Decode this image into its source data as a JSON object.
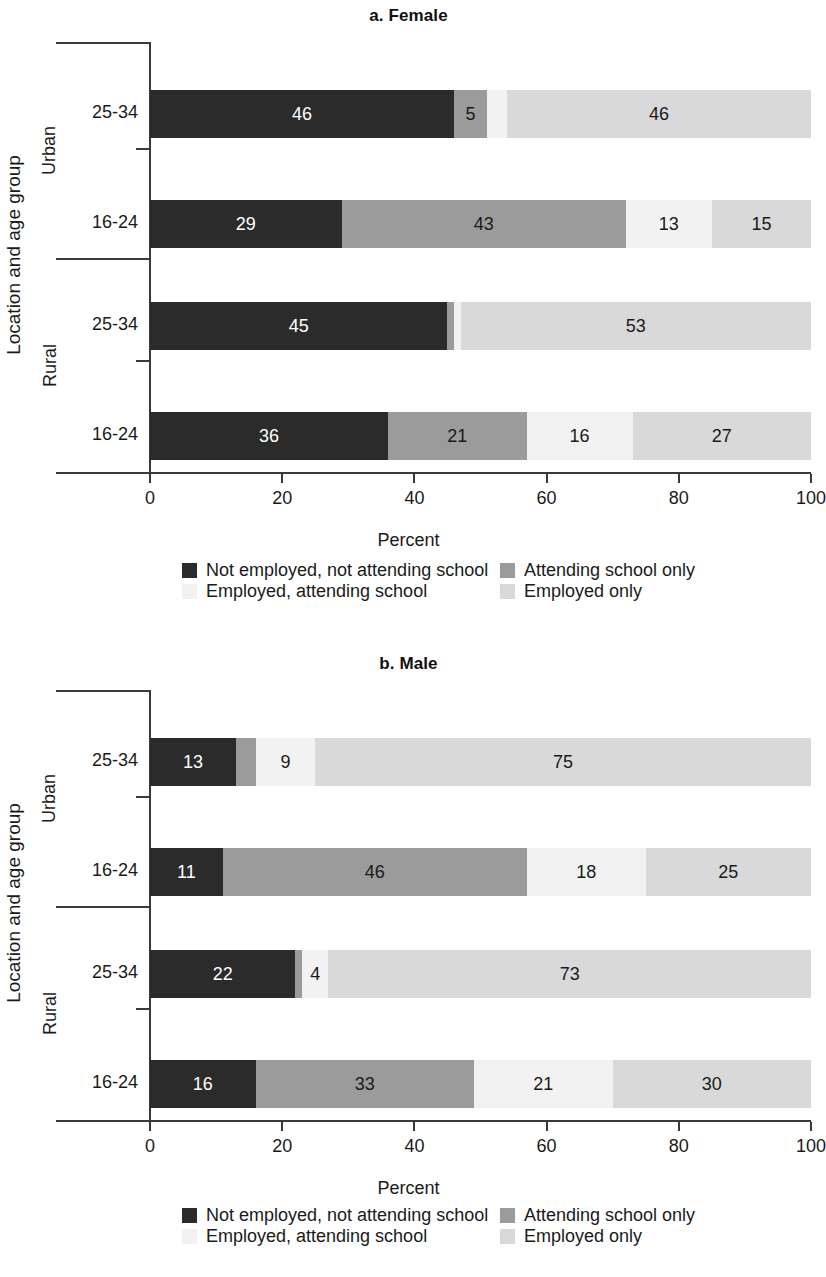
{
  "figure": {
    "xaxis_title": "Percent",
    "yaxis_title": "Location and age group",
    "xticks": [
      "0",
      "20",
      "40",
      "60",
      "80",
      "100"
    ],
    "xlim_min": 0,
    "xlim_max": 100
  },
  "legend": {
    "items": [
      {
        "label": "Not employed, not attending school",
        "color": "#2b2b2b",
        "key": "not_employed_not_attending"
      },
      {
        "label": "Attending school only",
        "color": "#9b9b9b",
        "key": "attending_only"
      },
      {
        "label": "Employed, attending school",
        "color": "#f2f2f2",
        "key": "employed_attending"
      },
      {
        "label": "Employed only",
        "color": "#d9d9d9",
        "key": "employed_only"
      }
    ]
  },
  "panels": [
    {
      "id": "panel-a",
      "title": "a. Female",
      "groups": [
        {
          "name": "Urban",
          "rows": [
            {
              "age": "25-34",
              "segments": [
                {
                  "series": "Not employed, not attending school",
                  "value": 46,
                  "label": "46",
                  "color": "#2b2b2b",
                  "text_color": "#ffffff",
                  "show_label": true
                },
                {
                  "series": "Attending school only",
                  "value": 5,
                  "label": "5",
                  "color": "#9b9b9b",
                  "text_color": "#1a1a1a",
                  "show_label": true
                },
                {
                  "series": "Employed, attending school",
                  "value": 3,
                  "label": "",
                  "color": "#f2f2f2",
                  "text_color": "#1a1a1a",
                  "show_label": false
                },
                {
                  "series": "Employed only",
                  "value": 46,
                  "label": "46",
                  "color": "#d9d9d9",
                  "text_color": "#1a1a1a",
                  "show_label": true
                }
              ]
            },
            {
              "age": "16-24",
              "segments": [
                {
                  "series": "Not employed, not attending school",
                  "value": 29,
                  "label": "29",
                  "color": "#2b2b2b",
                  "text_color": "#ffffff",
                  "show_label": true
                },
                {
                  "series": "Attending school only",
                  "value": 43,
                  "label": "43",
                  "color": "#9b9b9b",
                  "text_color": "#1a1a1a",
                  "show_label": true
                },
                {
                  "series": "Employed, attending school",
                  "value": 13,
                  "label": "13",
                  "color": "#f2f2f2",
                  "text_color": "#1a1a1a",
                  "show_label": true
                },
                {
                  "series": "Employed only",
                  "value": 15,
                  "label": "15",
                  "color": "#d9d9d9",
                  "text_color": "#1a1a1a",
                  "show_label": true
                }
              ]
            }
          ]
        },
        {
          "name": "Rural",
          "rows": [
            {
              "age": "25-34",
              "segments": [
                {
                  "series": "Not employed, not attending school",
                  "value": 45,
                  "label": "45",
                  "color": "#2b2b2b",
                  "text_color": "#ffffff",
                  "show_label": true
                },
                {
                  "series": "Attending school only",
                  "value": 1,
                  "label": "",
                  "color": "#9b9b9b",
                  "text_color": "#1a1a1a",
                  "show_label": false
                },
                {
                  "series": "Employed, attending school",
                  "value": 1,
                  "label": "",
                  "color": "#f2f2f2",
                  "text_color": "#1a1a1a",
                  "show_label": false
                },
                {
                  "series": "Employed only",
                  "value": 53,
                  "label": "53",
                  "color": "#d9d9d9",
                  "text_color": "#1a1a1a",
                  "show_label": true
                }
              ]
            },
            {
              "age": "16-24",
              "segments": [
                {
                  "series": "Not employed, not attending school",
                  "value": 36,
                  "label": "36",
                  "color": "#2b2b2b",
                  "text_color": "#ffffff",
                  "show_label": true
                },
                {
                  "series": "Attending school only",
                  "value": 21,
                  "label": "21",
                  "color": "#9b9b9b",
                  "text_color": "#1a1a1a",
                  "show_label": true
                },
                {
                  "series": "Employed, attending school",
                  "value": 16,
                  "label": "16",
                  "color": "#f2f2f2",
                  "text_color": "#1a1a1a",
                  "show_label": true
                },
                {
                  "series": "Employed only",
                  "value": 27,
                  "label": "27",
                  "color": "#d9d9d9",
                  "text_color": "#1a1a1a",
                  "show_label": true
                }
              ]
            }
          ]
        }
      ]
    },
    {
      "id": "panel-b",
      "title": "b. Male",
      "groups": [
        {
          "name": "Urban",
          "rows": [
            {
              "age": "25-34",
              "segments": [
                {
                  "series": "Not employed, not attending school",
                  "value": 13,
                  "label": "13",
                  "color": "#2b2b2b",
                  "text_color": "#ffffff",
                  "show_label": true
                },
                {
                  "series": "Attending school only",
                  "value": 3,
                  "label": "",
                  "color": "#9b9b9b",
                  "text_color": "#1a1a1a",
                  "show_label": false
                },
                {
                  "series": "Employed, attending school",
                  "value": 9,
                  "label": "9",
                  "color": "#f2f2f2",
                  "text_color": "#1a1a1a",
                  "show_label": true
                },
                {
                  "series": "Employed only",
                  "value": 75,
                  "label": "75",
                  "color": "#d9d9d9",
                  "text_color": "#1a1a1a",
                  "show_label": true
                }
              ]
            },
            {
              "age": "16-24",
              "segments": [
                {
                  "series": "Not employed, not attending school",
                  "value": 11,
                  "label": "11",
                  "color": "#2b2b2b",
                  "text_color": "#ffffff",
                  "show_label": true
                },
                {
                  "series": "Attending school only",
                  "value": 46,
                  "label": "46",
                  "color": "#9b9b9b",
                  "text_color": "#1a1a1a",
                  "show_label": true
                },
                {
                  "series": "Employed, attending school",
                  "value": 18,
                  "label": "18",
                  "color": "#f2f2f2",
                  "text_color": "#1a1a1a",
                  "show_label": true
                },
                {
                  "series": "Employed only",
                  "value": 25,
                  "label": "25",
                  "color": "#d9d9d9",
                  "text_color": "#1a1a1a",
                  "show_label": true
                }
              ]
            }
          ]
        },
        {
          "name": "Rural",
          "rows": [
            {
              "age": "25-34",
              "segments": [
                {
                  "series": "Not employed, not attending school",
                  "value": 22,
                  "label": "22",
                  "color": "#2b2b2b",
                  "text_color": "#ffffff",
                  "show_label": true
                },
                {
                  "series": "Attending school only",
                  "value": 1,
                  "label": "",
                  "color": "#9b9b9b",
                  "text_color": "#1a1a1a",
                  "show_label": false
                },
                {
                  "series": "Employed, attending school",
                  "value": 4,
                  "label": "4",
                  "color": "#f2f2f2",
                  "text_color": "#1a1a1a",
                  "show_label": true
                },
                {
                  "series": "Employed only",
                  "value": 73,
                  "label": "73",
                  "color": "#d9d9d9",
                  "text_color": "#1a1a1a",
                  "show_label": true
                }
              ]
            },
            {
              "age": "16-24",
              "segments": [
                {
                  "series": "Not employed, not attending school",
                  "value": 16,
                  "label": "16",
                  "color": "#2b2b2b",
                  "text_color": "#ffffff",
                  "show_label": true
                },
                {
                  "series": "Attending school only",
                  "value": 33,
                  "label": "33",
                  "color": "#9b9b9b",
                  "text_color": "#1a1a1a",
                  "show_label": true
                },
                {
                  "series": "Employed, attending school",
                  "value": 21,
                  "label": "21",
                  "color": "#f2f2f2",
                  "text_color": "#1a1a1a",
                  "show_label": true
                },
                {
                  "series": "Employed only",
                  "value": 30,
                  "label": "30",
                  "color": "#d9d9d9",
                  "text_color": "#1a1a1a",
                  "show_label": true
                }
              ]
            }
          ]
        }
      ]
    }
  ],
  "chart_data": {
    "type": "bar",
    "orientation": "horizontal",
    "stacked": true,
    "xlabel": "Percent",
    "ylabel": "Location and age group",
    "xlim": [
      0,
      100
    ],
    "xticks": [
      0,
      20,
      40,
      60,
      80,
      100
    ],
    "grid": false,
    "legend_position": "bottom",
    "series_names": [
      "Not employed, not attending school",
      "Attending school only",
      "Employed, attending school",
      "Employed only"
    ],
    "series_colors": [
      "#2b2b2b",
      "#9b9b9b",
      "#f2f2f2",
      "#d9d9d9"
    ],
    "panels": [
      {
        "panel": "a. Female",
        "categories": [
          "Urban 25-34",
          "Urban 16-24",
          "Rural 25-34",
          "Rural 16-24"
        ],
        "series": [
          {
            "name": "Not employed, not attending school",
            "values": [
              46,
              29,
              45,
              36
            ]
          },
          {
            "name": "Attending school only",
            "values": [
              5,
              43,
              1,
              21
            ]
          },
          {
            "name": "Employed, attending school",
            "values": [
              3,
              13,
              1,
              16
            ]
          },
          {
            "name": "Employed only",
            "values": [
              46,
              15,
              53,
              27
            ]
          }
        ]
      },
      {
        "panel": "b. Male",
        "categories": [
          "Urban 25-34",
          "Urban 16-24",
          "Rural 25-34",
          "Rural 16-24"
        ],
        "series": [
          {
            "name": "Not employed, not attending school",
            "values": [
              13,
              11,
              22,
              16
            ]
          },
          {
            "name": "Attending school only",
            "values": [
              3,
              46,
              1,
              33
            ]
          },
          {
            "name": "Employed, attending school",
            "values": [
              9,
              18,
              4,
              21
            ]
          },
          {
            "name": "Employed only",
            "values": [
              75,
              25,
              73,
              30
            ]
          }
        ]
      }
    ]
  }
}
